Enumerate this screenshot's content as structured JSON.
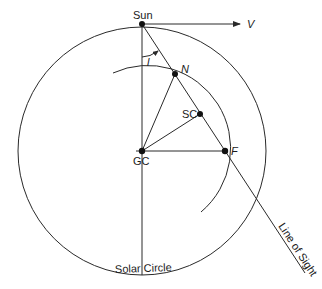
{
  "diagram": {
    "type": "galactic-rotation-geometry",
    "colors": {
      "line": "#2a2a2a",
      "point": "#111111",
      "text": "#1a1a1a",
      "background": "#ffffff"
    },
    "points": {
      "sun": {
        "label": "Sun",
        "x": 142,
        "y": 24
      },
      "galactic_center": {
        "label": "GC",
        "x": 142,
        "y": 151
      },
      "near_point": {
        "label": "N",
        "x": 175,
        "y": 74
      },
      "subcentral_point": {
        "label": "SC",
        "x": 200,
        "y": 114
      },
      "far_point": {
        "label": "F",
        "x": 225,
        "y": 151
      }
    },
    "labels": {
      "velocity": "V",
      "longitude_angle": "l",
      "solar_circle": "Solar Circle",
      "line_of_sight": "Line of Sight"
    },
    "circles": {
      "solar_circle": {
        "cx": 142,
        "cy": 151,
        "r": 124
      },
      "inner_arc": {
        "cx": 142,
        "cy": 151,
        "r": 83
      }
    }
  }
}
